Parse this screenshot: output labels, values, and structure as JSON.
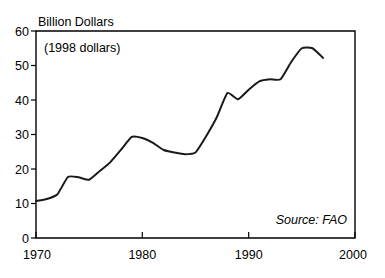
{
  "figure": {
    "background_color": "#ffffff",
    "line_color": "#1a1a1a",
    "axis_color": "#000000",
    "y_axis_title": "Billion Dollars",
    "annotation": "(1998 dollars)",
    "source": "Source:  FAO"
  },
  "chart_data": {
    "type": "line",
    "title": "",
    "subtitle": "(1998 dollars)",
    "xlabel": "",
    "ylabel": "Billion Dollars",
    "xlim": [
      1970,
      2000
    ],
    "ylim": [
      0,
      60
    ],
    "grid": false,
    "legend": false,
    "source_note": "Source:  FAO",
    "xticks": [
      1970,
      1980,
      1990,
      2000
    ],
    "xtick_labels": [
      "1970",
      "1980",
      "1990",
      "2000"
    ],
    "yticks": [
      0,
      10,
      20,
      30,
      40,
      50,
      60
    ],
    "ytick_labels": [
      "0",
      "10",
      "20",
      "30",
      "40",
      "50",
      "60"
    ],
    "x": [
      1970,
      1971,
      1972,
      1973,
      1974,
      1975,
      1976,
      1977,
      1978,
      1979,
      1980,
      1981,
      1982,
      1983,
      1984,
      1985,
      1986,
      1987,
      1988,
      1989,
      1990,
      1991,
      1992,
      1993,
      1994,
      1995,
      1996,
      1997
    ],
    "values": [
      10.7,
      11.3,
      12.6,
      17.7,
      17.6,
      16.9,
      19.4,
      22.0,
      25.6,
      29.3,
      29.0,
      27.6,
      25.5,
      24.8,
      24.3,
      24.8,
      29.5,
      35.0,
      42.0,
      40.2,
      43.0,
      45.4,
      46.0,
      46.0,
      51.0,
      55.0,
      55.0,
      52.2
    ],
    "series": [
      {
        "name": "Value",
        "values": [
          10.7,
          11.3,
          12.6,
          17.7,
          17.6,
          16.9,
          19.4,
          22.0,
          25.6,
          29.3,
          29.0,
          27.6,
          25.5,
          24.8,
          24.3,
          24.8,
          29.5,
          35.0,
          42.0,
          40.2,
          43.0,
          45.4,
          46.0,
          46.0,
          51.0,
          55.0,
          55.0,
          52.2
        ]
      }
    ]
  }
}
